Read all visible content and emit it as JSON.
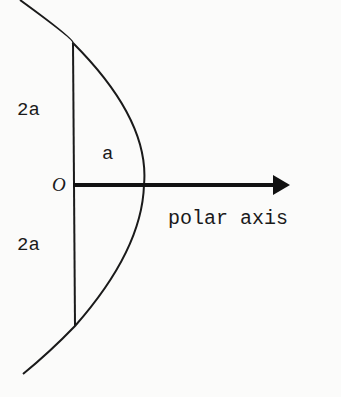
{
  "diagram": {
    "labels": {
      "upper_length": "2a",
      "lower_length": "2a",
      "vertex_distance": "a",
      "origin": "O",
      "axis": "polar axis"
    },
    "colors": {
      "ink": "#1a1a1a",
      "paper": "#fbfbfa"
    },
    "geometry": {
      "origin": [
        73,
        185
      ],
      "vertex": [
        144,
        185
      ],
      "latus_rectum_top": [
        73,
        43
      ],
      "latus_rectum_bottom": [
        75,
        326
      ],
      "axis_end": [
        290,
        185
      ]
    }
  }
}
